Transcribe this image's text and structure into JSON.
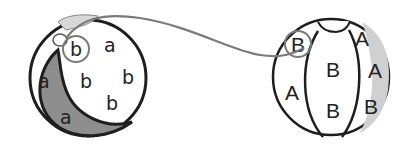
{
  "diagram": {
    "type": "matching-exercise",
    "left_ball": {
      "case": "lowercase",
      "letters": [
        {
          "char": "b",
          "circled": true
        },
        {
          "char": "a"
        },
        {
          "char": "a"
        },
        {
          "char": "b"
        },
        {
          "char": "b"
        },
        {
          "char": "b"
        },
        {
          "char": "a"
        }
      ]
    },
    "right_ball": {
      "case": "uppercase",
      "letters": [
        {
          "char": "B",
          "circled": true
        },
        {
          "char": "A"
        },
        {
          "char": "B"
        },
        {
          "char": "A"
        },
        {
          "char": "A"
        },
        {
          "char": "B"
        },
        {
          "char": "B"
        }
      ]
    },
    "connector": {
      "from": "b",
      "to": "B",
      "color": "#7a7a7a"
    },
    "colors": {
      "outline": "#1e1e1e",
      "shade": "#8e8e8e",
      "light_shade": "#d8d8d8",
      "ink": "#222222"
    }
  }
}
